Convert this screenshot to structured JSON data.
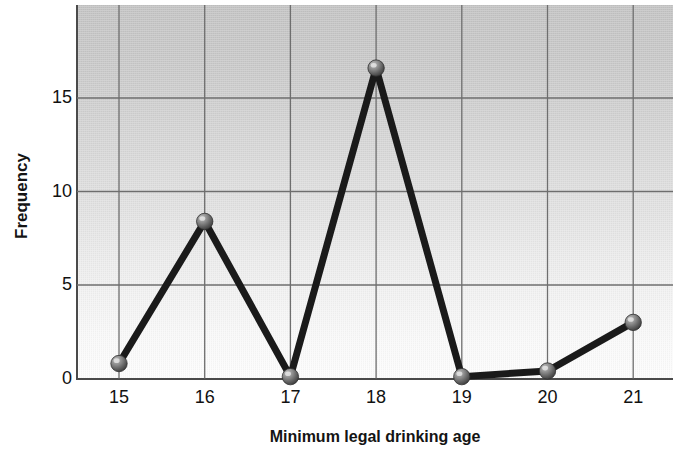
{
  "chart_data": {
    "type": "line",
    "title": "",
    "xlabel": "Minimum legal drinking age",
    "ylabel": "Frequency",
    "categories": [
      15,
      16,
      17,
      18,
      19,
      20,
      21
    ],
    "x_tick_labels": [
      "15",
      "16",
      "17",
      "18",
      "19",
      "20",
      "21"
    ],
    "y_tick_labels": [
      "0",
      "5",
      "10",
      "15"
    ],
    "values": [
      0.8,
      8.4,
      0.1,
      16.6,
      0.1,
      0.4,
      3.0
    ],
    "series": [
      {
        "name": "Frequency",
        "values": [
          0.8,
          8.4,
          0.1,
          16.6,
          0.1,
          0.4,
          3.0
        ]
      }
    ],
    "xlim": [
      14.5,
      21.5
    ],
    "ylim": [
      0,
      20
    ],
    "y_ticks": [
      0,
      5,
      10,
      15
    ],
    "grid": true,
    "legend": "none",
    "marker": "sphere",
    "line_color": "#1a1a1a",
    "marker_color": "#6b6b6b",
    "gridline_color": "#6e6e6e",
    "plot_bg_top": "#c4c4c4",
    "plot_bg_bottom": "#fdfdfd",
    "axis_color": "#4a4a4a",
    "text_color": "#111111"
  },
  "axis": {
    "x_title": "Minimum legal drinking age",
    "y_title": "Frequency"
  }
}
